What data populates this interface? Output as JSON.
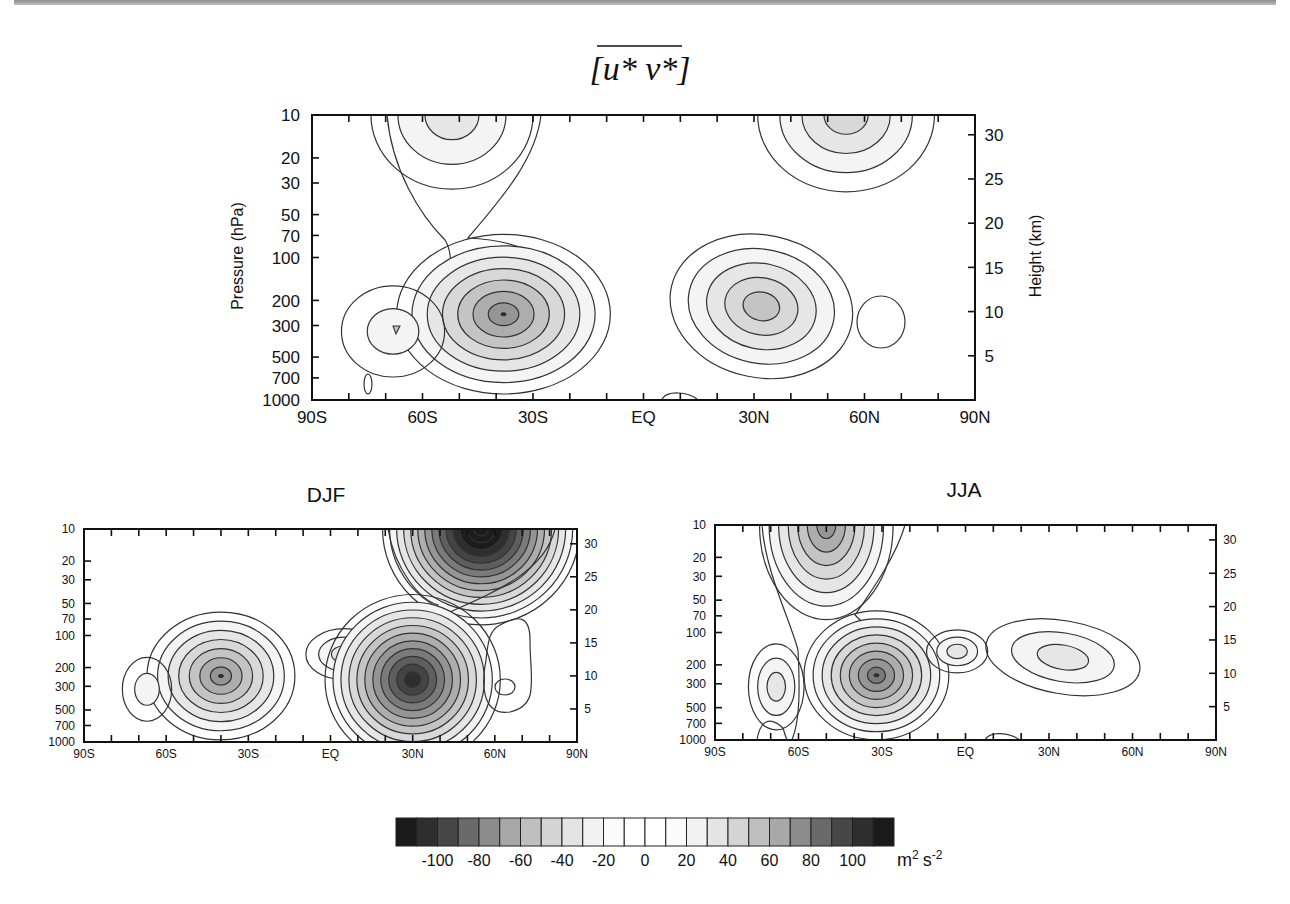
{
  "figure": {
    "title_math": "[u* v*]",
    "title_parts": {
      "open": "[",
      "u": "u*",
      "v": "v*",
      "close": "]"
    },
    "units": "m² s⁻²",
    "units_parts": {
      "m": "m",
      "m_exp": "2",
      "s": "s",
      "s_exp": "-2"
    }
  },
  "chart_data": [
    {
      "type": "heatmap",
      "panel": "annual",
      "title": "[u* v*] (zonal-mean eddy momentum flux)",
      "xlabel": "",
      "ylabel": "Pressure  (hPa)",
      "ylabel_right": "Height (km)",
      "x_ticks": [
        "90S",
        "60S",
        "30S",
        "EQ",
        "30N",
        "60N",
        "90N"
      ],
      "y_ticks_left": [
        "10",
        "20",
        "30",
        "50",
        "70",
        "100",
        "200",
        "300",
        "500",
        "700",
        "1000"
      ],
      "y_ticks_right": [
        "30",
        "25",
        "20",
        "15",
        "10",
        "5"
      ],
      "xlim": [
        -90,
        90
      ],
      "ylim_hPa": [
        1000,
        10
      ],
      "contour_interval": 10,
      "features": [
        {
          "lat": -38,
          "p_hPa": 250,
          "peak": 60,
          "sign": "positive"
        },
        {
          "lat": 32,
          "p_hPa": 220,
          "peak": -50,
          "sign": "negative"
        },
        {
          "lat": -68,
          "p_hPa": 320,
          "peak": -25,
          "sign": "negative"
        },
        {
          "lat": -52,
          "p_hPa": 10,
          "peak": 30,
          "sign": "positive"
        },
        {
          "lat": 55,
          "p_hPa": 10,
          "peak": -40,
          "sign": "negative"
        },
        {
          "lat": 66,
          "p_hPa": 300,
          "peak": 10,
          "sign": "positive"
        }
      ]
    },
    {
      "type": "heatmap",
      "panel": "DJF",
      "title": "DJF",
      "x_ticks": [
        "90S",
        "60S",
        "30S",
        "EQ",
        "30N",
        "60N",
        "90N"
      ],
      "y_ticks_left": [
        "10",
        "20",
        "30",
        "50",
        "70",
        "100",
        "200",
        "300",
        "500",
        "700",
        "1000"
      ],
      "y_ticks_right": [
        "30",
        "25",
        "20",
        "15",
        "10",
        "5"
      ],
      "xlim": [
        -90,
        90
      ],
      "ylim_hPa": [
        1000,
        10
      ],
      "contour_interval": 10,
      "features": [
        {
          "lat": -40,
          "p_hPa": 240,
          "peak": 70,
          "sign": "positive"
        },
        {
          "lat": 30,
          "p_hPa": 260,
          "peak": -90,
          "sign": "negative"
        },
        {
          "lat": -67,
          "p_hPa": 320,
          "peak": -20,
          "sign": "negative"
        },
        {
          "lat": 5,
          "p_hPa": 150,
          "peak": -30,
          "sign": "negative"
        },
        {
          "lat": 55,
          "p_hPa": 10,
          "peak": 120,
          "sign": "positive"
        },
        {
          "lat": 67,
          "p_hPa": 300,
          "peak": 10,
          "sign": "positive"
        }
      ]
    },
    {
      "type": "heatmap",
      "panel": "JJA",
      "title": "JJA",
      "x_ticks": [
        "90S",
        "60S",
        "30S",
        "EQ",
        "30N",
        "60N",
        "90N"
      ],
      "y_ticks_left": [
        "10",
        "20",
        "30",
        "50",
        "70",
        "100",
        "200",
        "300",
        "500",
        "700",
        "1000"
      ],
      "y_ticks_right": [
        "30",
        "25",
        "20",
        "15",
        "10",
        "5"
      ],
      "xlim": [
        -90,
        90
      ],
      "ylim_hPa": [
        1000,
        10
      ],
      "contour_interval": 10,
      "features": [
        {
          "lat": -32,
          "p_hPa": 250,
          "peak": 80,
          "sign": "positive"
        },
        {
          "lat": -50,
          "p_hPa": 10,
          "peak": 80,
          "sign": "positive"
        },
        {
          "lat": -68,
          "p_hPa": 320,
          "peak": -30,
          "sign": "negative"
        },
        {
          "lat": -3,
          "p_hPa": 150,
          "peak": -30,
          "sign": "negative"
        },
        {
          "lat": 35,
          "p_hPa": 170,
          "peak": -30,
          "sign": "negative"
        }
      ]
    }
  ],
  "panels": {
    "annual": {
      "title": "",
      "ylabel": "Pressure  (hPa)",
      "ylabel_right": "Height (km)"
    },
    "djf": {
      "title": "DJF"
    },
    "jja": {
      "title": "JJA"
    }
  },
  "axis": {
    "x_ticks": [
      "90S",
      "60S",
      "30S",
      "EQ",
      "30N",
      "60N",
      "90N"
    ],
    "p_ticks": [
      "10",
      "20",
      "30",
      "50",
      "70",
      "100",
      "200",
      "300",
      "500",
      "700",
      "1000"
    ],
    "z_ticks": [
      "30",
      "25",
      "20",
      "15",
      "10",
      "5"
    ]
  },
  "colorbar": {
    "labels": [
      "-100",
      "-80",
      "-60",
      "-40",
      "-20",
      "0",
      "20",
      "40",
      "60",
      "80",
      "100"
    ],
    "unit": "m² s⁻²",
    "swatches": [
      "#1a1a1a",
      "#2e2e2e",
      "#474747",
      "#6a6a6a",
      "#8c8c8c",
      "#a8a8a8",
      "#bfbfbf",
      "#d4d4d4",
      "#e4e4e4",
      "#f2f2f2",
      "#fbfbfb",
      "#ffffff",
      "#ffffff",
      "#fbfbfb",
      "#f2f2f2",
      "#e4e4e4",
      "#d4d4d4",
      "#bfbfbf",
      "#a8a8a8",
      "#8c8c8c",
      "#6a6a6a",
      "#474747",
      "#2e2e2e",
      "#1a1a1a"
    ]
  }
}
